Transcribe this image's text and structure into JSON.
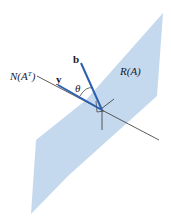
{
  "labels": {
    "null_space": "N(A",
    "null_space_sup": "T",
    "null_space_close": ")",
    "range": "R(A)",
    "vec_b": "b",
    "vec_y": "y",
    "angle": "θ"
  },
  "colors": {
    "plane": "#c5d9ee",
    "vector": "#2a5fb0",
    "line": "#333333"
  }
}
